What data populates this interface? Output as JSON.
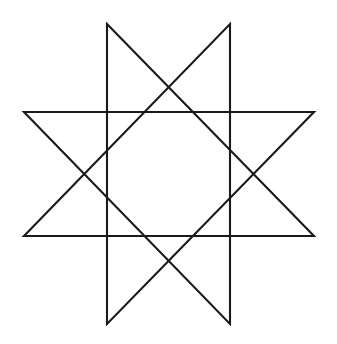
{
  "figure": {
    "title": "Eight-pointed star polygon",
    "shape_name": "octagram",
    "schlafli_symbol": "{8/3}",
    "point_count": 8,
    "step": 3,
    "background_color": "#ffffff",
    "stroke_color": "#1a1a1a",
    "stroke_width": 2.1,
    "canvas": {
      "width": 337,
      "height": 344
    },
    "center": {
      "x": 169,
      "y": 174
    },
    "vertices": [
      {
        "name": "top-left",
        "x": 107,
        "y": 24
      },
      {
        "name": "top-right",
        "x": 230,
        "y": 24
      },
      {
        "name": "right-upper",
        "x": 314,
        "y": 112
      },
      {
        "name": "right-lower",
        "x": 314,
        "y": 236
      },
      {
        "name": "bottom-right",
        "x": 230,
        "y": 324
      },
      {
        "name": "bottom-left",
        "x": 107,
        "y": 324
      },
      {
        "name": "left-lower",
        "x": 24,
        "y": 236
      },
      {
        "name": "left-upper",
        "x": 24,
        "y": 112
      }
    ],
    "path_order": [
      0,
      3,
      6,
      1,
      4,
      7,
      2,
      5
    ],
    "path_d": "M 107 24 L 314 236 L 24 236 L 230 24 L 230 324 L 24 112 L 314 112 L 107 324 Z"
  }
}
